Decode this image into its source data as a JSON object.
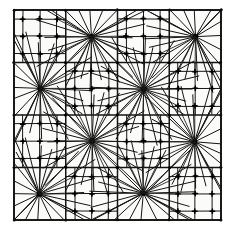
{
  "figure": {
    "canvas": {
      "width": 231,
      "height": 229,
      "background": "#ffffff"
    }
  },
  "colors": {
    "ink": "#141414",
    "frame": "#111111",
    "paper": "#fbfbf9",
    "node": "#000000"
  },
  "domain": {
    "x0": 14,
    "y0": 10,
    "x1": 221,
    "y1": 220,
    "macro_cols": 4,
    "macro_rows": 4
  },
  "mesh_data": {
    "type": "mesh",
    "pattern": "checkerboard",
    "hub_parity": "odd",
    "hub_count": 8,
    "refined_block_count": 8,
    "spokes_per_hub": 24,
    "refined_interior_nodes": 3,
    "hubs": [
      {
        "id": "H1",
        "col": 1,
        "row": 0
      },
      {
        "id": "H2",
        "col": 3,
        "row": 0
      },
      {
        "id": "H3",
        "col": 0,
        "row": 1
      },
      {
        "id": "H4",
        "col": 2,
        "row": 1
      },
      {
        "id": "H5",
        "col": 1,
        "row": 2
      },
      {
        "id": "H6",
        "col": 3,
        "row": 2
      },
      {
        "id": "H7",
        "col": 0,
        "row": 3
      },
      {
        "id": "H8",
        "col": 2,
        "row": 3
      }
    ],
    "refined_blocks": [
      {
        "id": "R1",
        "col": 0,
        "row": 0
      },
      {
        "id": "R2",
        "col": 2,
        "row": 0
      },
      {
        "id": "R3",
        "col": 1,
        "row": 1
      },
      {
        "id": "R4",
        "col": 3,
        "row": 1
      },
      {
        "id": "R5",
        "col": 0,
        "row": 2
      },
      {
        "id": "R6",
        "col": 2,
        "row": 2
      },
      {
        "id": "R7",
        "col": 1,
        "row": 3
      },
      {
        "id": "R8",
        "col": 3,
        "row": 3
      }
    ]
  }
}
